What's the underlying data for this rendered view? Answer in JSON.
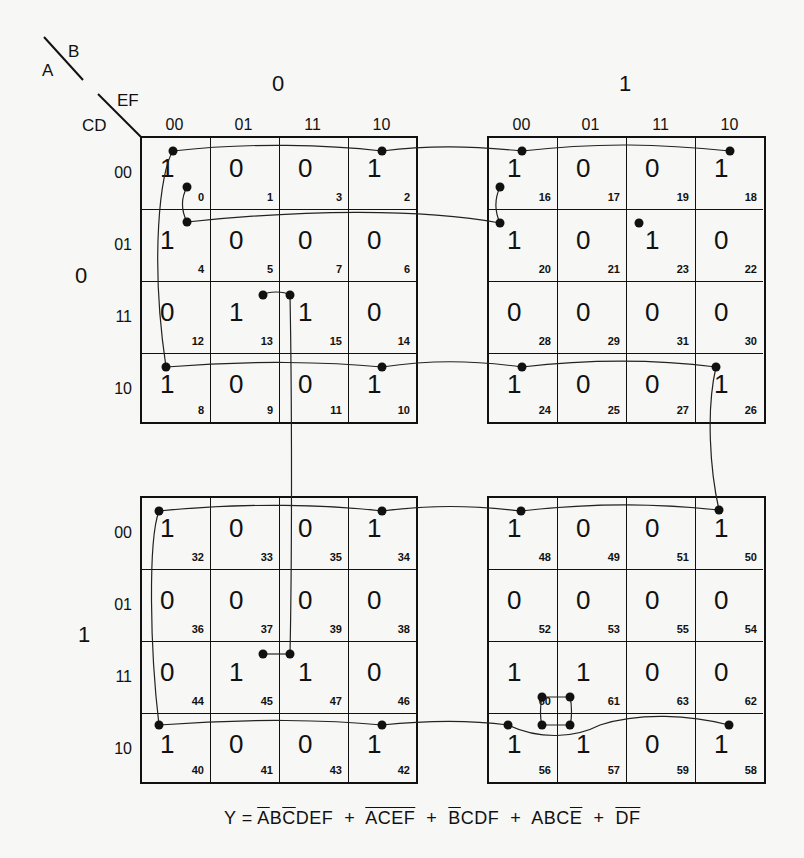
{
  "header": {
    "var_A": "A",
    "var_B": "B",
    "var_CD": "CD",
    "var_EF": "EF",
    "b_values": [
      "0",
      "1"
    ],
    "a_values": [
      "0",
      "1"
    ],
    "ef_columns": [
      "00",
      "01",
      "11",
      "10"
    ],
    "cd_rows": [
      "00",
      "01",
      "11",
      "10"
    ]
  },
  "maps": [
    {
      "a": "0",
      "b": "0",
      "cells": [
        [
          {
            "v": "1",
            "i": "0"
          },
          {
            "v": "0",
            "i": "1"
          },
          {
            "v": "0",
            "i": "3"
          },
          {
            "v": "1",
            "i": "2"
          }
        ],
        [
          {
            "v": "1",
            "i": "4"
          },
          {
            "v": "0",
            "i": "5"
          },
          {
            "v": "0",
            "i": "7"
          },
          {
            "v": "0",
            "i": "6"
          }
        ],
        [
          {
            "v": "0",
            "i": "12"
          },
          {
            "v": "1",
            "i": "13"
          },
          {
            "v": "1",
            "i": "15"
          },
          {
            "v": "0",
            "i": "14"
          }
        ],
        [
          {
            "v": "1",
            "i": "8"
          },
          {
            "v": "0",
            "i": "9"
          },
          {
            "v": "0",
            "i": "11"
          },
          {
            "v": "1",
            "i": "10"
          }
        ]
      ]
    },
    {
      "a": "0",
      "b": "1",
      "cells": [
        [
          {
            "v": "1",
            "i": "16"
          },
          {
            "v": "0",
            "i": "17"
          },
          {
            "v": "0",
            "i": "19"
          },
          {
            "v": "1",
            "i": "18"
          }
        ],
        [
          {
            "v": "1",
            "i": "20"
          },
          {
            "v": "0",
            "i": "21"
          },
          {
            "v": "1",
            "i": "23"
          },
          {
            "v": "0",
            "i": "22"
          }
        ],
        [
          {
            "v": "0",
            "i": "28"
          },
          {
            "v": "0",
            "i": "29"
          },
          {
            "v": "0",
            "i": "31"
          },
          {
            "v": "0",
            "i": "30"
          }
        ],
        [
          {
            "v": "1",
            "i": "24"
          },
          {
            "v": "0",
            "i": "25"
          },
          {
            "v": "0",
            "i": "27"
          },
          {
            "v": "1",
            "i": "26"
          }
        ]
      ]
    },
    {
      "a": "1",
      "b": "0",
      "cells": [
        [
          {
            "v": "1",
            "i": "32"
          },
          {
            "v": "0",
            "i": "33"
          },
          {
            "v": "0",
            "i": "35"
          },
          {
            "v": "1",
            "i": "34"
          }
        ],
        [
          {
            "v": "0",
            "i": "36"
          },
          {
            "v": "0",
            "i": "37"
          },
          {
            "v": "0",
            "i": "39"
          },
          {
            "v": "0",
            "i": "38"
          }
        ],
        [
          {
            "v": "0",
            "i": "44"
          },
          {
            "v": "1",
            "i": "45"
          },
          {
            "v": "1",
            "i": "47"
          },
          {
            "v": "0",
            "i": "46"
          }
        ],
        [
          {
            "v": "1",
            "i": "40"
          },
          {
            "v": "0",
            "i": "41"
          },
          {
            "v": "0",
            "i": "43"
          },
          {
            "v": "1",
            "i": "42"
          }
        ]
      ]
    },
    {
      "a": "1",
      "b": "1",
      "cells": [
        [
          {
            "v": "1",
            "i": "48"
          },
          {
            "v": "0",
            "i": "49"
          },
          {
            "v": "0",
            "i": "51"
          },
          {
            "v": "1",
            "i": "50"
          }
        ],
        [
          {
            "v": "0",
            "i": "52"
          },
          {
            "v": "0",
            "i": "53"
          },
          {
            "v": "0",
            "i": "55"
          },
          {
            "v": "0",
            "i": "54"
          }
        ],
        [
          {
            "v": "1",
            "i": "60"
          },
          {
            "v": "1",
            "i": "61"
          },
          {
            "v": "0",
            "i": "63"
          },
          {
            "v": "0",
            "i": "62"
          }
        ],
        [
          {
            "v": "1",
            "i": "56"
          },
          {
            "v": "1",
            "i": "57"
          },
          {
            "v": "0",
            "i": "59"
          },
          {
            "v": "1",
            "i": "58"
          }
        ]
      ]
    }
  ],
  "equation": {
    "lhs": "Y =",
    "terms": [
      [
        {
          "t": "A",
          "bar": true
        },
        {
          "t": "B",
          "bar": false
        },
        {
          "t": "C",
          "bar": true
        },
        {
          "t": "DEF",
          "bar": false
        }
      ],
      [
        {
          "t": "ACEF",
          "bar": true
        }
      ],
      [
        {
          "t": "B",
          "bar": true
        },
        {
          "t": "CDF",
          "bar": false
        }
      ],
      [
        {
          "t": "ABC",
          "bar": false
        },
        {
          "t": "E",
          "bar": true
        }
      ],
      [
        {
          "t": "D",
          "bar": true
        },
        {
          "t": "F",
          "bar": true
        }
      ]
    ],
    "plus": "+"
  },
  "colors": {
    "ink": "#111111",
    "paper": "#f7f7f5"
  }
}
